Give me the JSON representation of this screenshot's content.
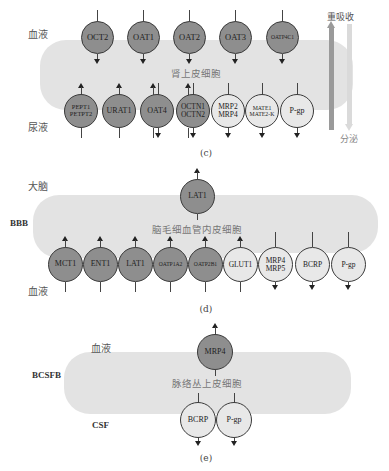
{
  "panel_c": {
    "caption": "(c)",
    "top_label": "血液",
    "bottom_label": "尿液",
    "cell_label": "肾上皮细胞",
    "reabsorption_label": "重吸收",
    "secretion_label": "分泌",
    "top_transporters": [
      {
        "name": "OCT2",
        "fill": "dark",
        "direction": "in"
      },
      {
        "name": "OAT1",
        "fill": "dark",
        "direction": "in"
      },
      {
        "name": "OAT2",
        "fill": "dark",
        "direction": "in"
      },
      {
        "name": "OAT3",
        "fill": "dark",
        "direction": "in"
      },
      {
        "name": "OATP4C1",
        "fill": "dark",
        "direction": "in"
      }
    ],
    "bottom_transporters": [
      {
        "name": "PEPT1",
        "name2": "PETPT2",
        "fill": "dark",
        "direction": "up"
      },
      {
        "name": "URAT1",
        "fill": "dark",
        "direction": "up"
      },
      {
        "name": "OAT4",
        "fill": "dark",
        "direction": "both"
      },
      {
        "name": "OCTN1",
        "name2": "OCTN2",
        "fill": "dark",
        "direction": "both"
      },
      {
        "name": "MRP2",
        "name2": "MRP4",
        "fill": "light",
        "direction": "down"
      },
      {
        "name": "MATE1",
        "name2": "MATE2-K",
        "fill": "light",
        "direction": "down"
      },
      {
        "name": "P-gp",
        "fill": "light",
        "direction": "down"
      }
    ]
  },
  "panel_d": {
    "caption": "(d)",
    "side_label": "BBB",
    "top_label": "大脑",
    "bottom_label": "血液",
    "cell_label": "脑毛细血管内皮细胞",
    "top_transporters": [
      {
        "name": "LAT1",
        "fill": "dark",
        "direction": "up"
      }
    ],
    "bottom_transporters": [
      {
        "name": "MCT1",
        "fill": "dark",
        "direction": "up"
      },
      {
        "name": "ENT1",
        "fill": "dark",
        "direction": "up"
      },
      {
        "name": "LAT1",
        "fill": "dark",
        "direction": "up"
      },
      {
        "name": "OATP1A2",
        "fill": "dark",
        "direction": "up"
      },
      {
        "name": "OATP2B1",
        "fill": "dark",
        "direction": "up"
      },
      {
        "name": "GLUT1",
        "fill": "light",
        "direction": "up"
      },
      {
        "name": "MRP4",
        "name2": "MRP5",
        "fill": "light",
        "direction": "down"
      },
      {
        "name": "BCRP",
        "fill": "light",
        "direction": "down"
      },
      {
        "name": "P-gp",
        "fill": "light",
        "direction": "down"
      }
    ]
  },
  "panel_e": {
    "caption": "(e)",
    "side_label": "BCSFB",
    "top_label": "血液",
    "bottom_label": "CSF",
    "cell_label": "脉络丛上皮细胞",
    "top_transporters": [
      {
        "name": "MRP4",
        "fill": "dark",
        "direction": "up"
      }
    ],
    "bottom_transporters": [
      {
        "name": "BCRP",
        "fill": "light",
        "direction": "down"
      },
      {
        "name": "P-gp",
        "fill": "light",
        "direction": "down"
      }
    ]
  },
  "colors": {
    "dark_transporter": "#8e8e8e",
    "light_transporter": "#e8e8e8",
    "cell_background": "#e3e3e3",
    "reabsorption_arrow": "#9a9a9a",
    "secretion_arrow": "#d9d9d9"
  }
}
